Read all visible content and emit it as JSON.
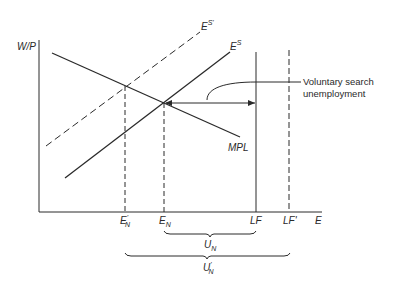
{
  "diagram": {
    "type": "labor-market-diagram",
    "axes": {
      "y_label": "W/P",
      "x_label": "E"
    },
    "curves": {
      "labor_supply": {
        "label_base": "E",
        "label_sup": "S"
      },
      "labor_supply_shifted": {
        "label_base": "E",
        "label_sup": "S'"
      },
      "labor_demand": {
        "label": "MPL"
      }
    },
    "x_markers": {
      "en_prime": {
        "base": "E",
        "sub": "N",
        "prime": "'"
      },
      "en": {
        "base": "E",
        "sub": "N"
      },
      "lf": {
        "label": "LF"
      },
      "lf_prime": {
        "label": "LF'"
      }
    },
    "annotation": {
      "line1": "Voluntary search",
      "line2": "unemployment"
    },
    "braces": {
      "un": {
        "base": "U",
        "sub": "N"
      },
      "un_prime": {
        "base": "U",
        "sub": "N",
        "prime": "'"
      }
    },
    "colors": {
      "ink": "#2a2a2a",
      "background": "#ffffff"
    }
  }
}
